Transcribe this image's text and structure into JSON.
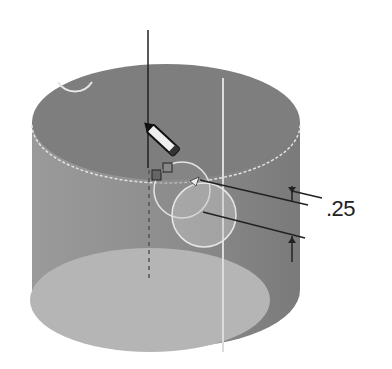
{
  "diagram": {
    "type": "cad-cylinder-sketch",
    "dimension": {
      "value": ".25"
    },
    "colors": {
      "cylinder_side": "#8a8a8a",
      "cylinder_top": "#7d7d7d",
      "cylinder_bottom": "#b3b3b3",
      "edge_highlight": "#e6e6e6",
      "lines": "#2a2a2a",
      "background": "#ffffff"
    },
    "elements": [
      {
        "name": "cylinder",
        "shape": "cylinder"
      },
      {
        "name": "vertical-axis-line",
        "shape": "line"
      },
      {
        "name": "sketch-pencil-cursor",
        "shape": "icon"
      },
      {
        "name": "sketch-circle-small",
        "shape": "circle"
      },
      {
        "name": "sketch-circle-large",
        "shape": "circle"
      },
      {
        "name": "corner-circle",
        "shape": "arc"
      },
      {
        "name": "dimension-callout",
        "shape": "dimension"
      }
    ]
  }
}
